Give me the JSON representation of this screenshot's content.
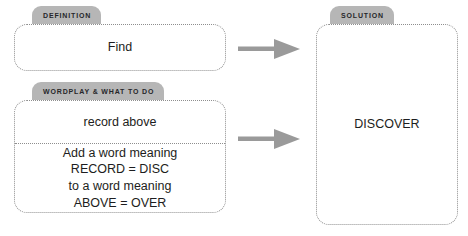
{
  "diagram": {
    "title_colors": {
      "tab_background": "#b6b6b6",
      "tab_text": "#26262a",
      "box_border": "#8e8e8e",
      "box_background": "#ffffff",
      "arrow": "#9a9a9a",
      "body_text": "#1d1d20"
    },
    "panels": {
      "definition": {
        "tab_label": "DEFINITION",
        "content": "Find"
      },
      "wordplay": {
        "tab_label": "WORDPLAY & WHAT TO DO",
        "clue_fragment": "record above",
        "instructions": [
          "Add a word meaning",
          "RECORD = DISC",
          "to a word meaning",
          "ABOVE = OVER"
        ]
      },
      "solution": {
        "tab_label": "SOLUTION",
        "answer": "DISCOVER"
      }
    },
    "arrows": [
      {
        "name": "arrow-definition-to-solution",
        "icon": "right-arrow-icon"
      },
      {
        "name": "arrow-wordplay-to-solution",
        "icon": "right-arrow-icon"
      }
    ]
  }
}
